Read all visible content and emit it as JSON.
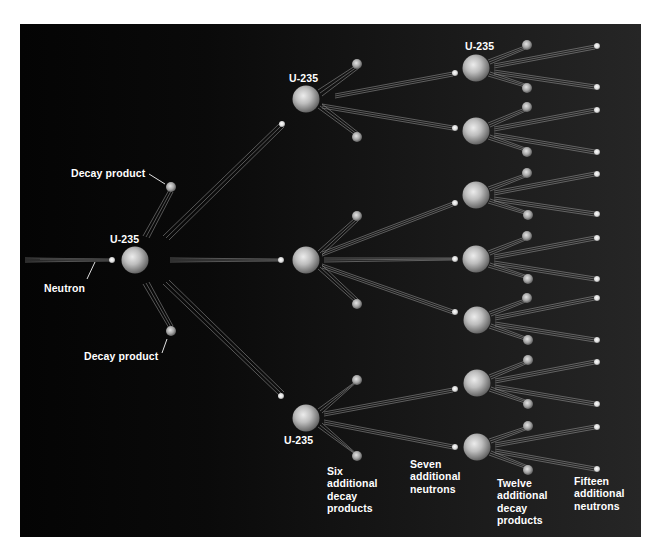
{
  "diagram": {
    "colors": {
      "background_left": "#040404",
      "background_right": "#262626",
      "label_text": "#ffffff",
      "nucleus_light": "#e6e6e6",
      "nucleus_dark": "#6a6a6a",
      "trail": "#bdbdbd"
    },
    "labels": {
      "decay_product_top": "Decay product",
      "decay_product_bottom": "Decay product",
      "neutron": "Neutron",
      "u235_first": "U-235",
      "u235_gen2_top": "U-235",
      "u235_gen2_bottom": "U-235",
      "u235_gen3_top": "U-235",
      "six_decay": [
        "Six",
        "additional",
        "decay",
        "products"
      ],
      "seven_neutrons": [
        "Seven",
        "additional",
        "neutrons"
      ],
      "twelve_decay": [
        "Twelve",
        "additional",
        "decay",
        "products"
      ],
      "fifteen_neutrons": [
        "Fifteen",
        "additional",
        "neutrons"
      ]
    },
    "generations": [
      {
        "name": "initial",
        "nuclei": 1,
        "incoming_neutrons": 1,
        "decay_products": 2,
        "outgoing_neutrons": 3
      },
      {
        "name": "second",
        "nuclei": 3,
        "decay_products": 6,
        "outgoing_neutrons": 7
      },
      {
        "name": "third",
        "nuclei": 7,
        "decay_products": 12,
        "outgoing_neutrons": 15
      }
    ]
  }
}
